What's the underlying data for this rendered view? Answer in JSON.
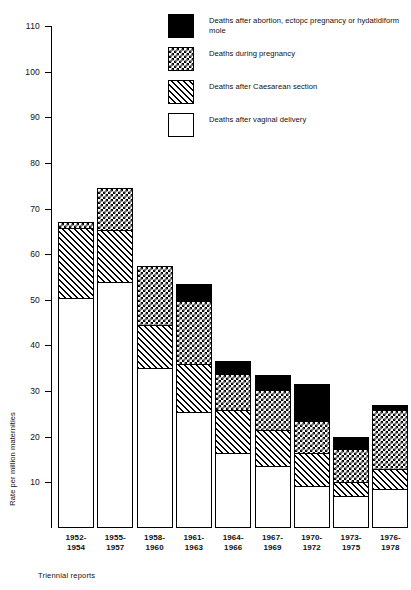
{
  "chart_data": {
    "type": "bar",
    "subtype": "stacked",
    "title": "",
    "xlabel": "Triennial reports",
    "ylabel": "Rate per million maternities",
    "ylim": [
      0,
      110
    ],
    "ytick_step": 10,
    "yticks": [
      110,
      100,
      90,
      80,
      70,
      60,
      50,
      40,
      30,
      20,
      10
    ],
    "ytick_labels": [
      "110",
      "100",
      "90",
      "80",
      "70",
      "60",
      "50",
      "40",
      "30",
      "20",
      "10"
    ],
    "grid": false,
    "legend_position": "top-right",
    "categories": [
      "1952-\n1954",
      "1955-\n1957",
      "1958-\n1960",
      "1961-\n1963",
      "1964-\n1966",
      "1967-\n1969",
      "1970-\n1972",
      "1973-\n1975",
      "1976-\n1978"
    ],
    "category_lines": [
      [
        "1952-",
        "1954"
      ],
      [
        "1955-",
        "1957"
      ],
      [
        "1958-",
        "1960"
      ],
      [
        "1961-",
        "1963"
      ],
      [
        "1964-",
        "1966"
      ],
      [
        "1967-",
        "1969"
      ],
      [
        "1970-",
        "1972"
      ],
      [
        "1973-",
        "1975"
      ],
      [
        "1976-",
        "1978"
      ]
    ],
    "series": [
      {
        "name": "Deaths after abortion, ectopic pregnancy or hydatidiform mole",
        "key": "abortion",
        "pattern": "solid-black",
        "values": [
          0,
          0,
          0,
          3.5,
          2.5,
          3.0,
          8.0,
          2.5,
          1.0
        ]
      },
      {
        "name": "Deaths during pregnancy",
        "key": "pregnancy",
        "pattern": "checkerboard",
        "values": [
          1.0,
          9.0,
          13.0,
          14.0,
          8.0,
          9.0,
          7.0,
          7.5,
          13.0
        ]
      },
      {
        "name": "Deaths after Caesarean section",
        "key": "caesarean",
        "pattern": "diagonal-hatch",
        "values": [
          15.5,
          11.5,
          9.5,
          10.5,
          9.5,
          8.0,
          7.5,
          3.0,
          4.5
        ]
      },
      {
        "name": "Deaths after vaginal delivery",
        "key": "vaginal",
        "pattern": "white",
        "values": [
          50.5,
          54.0,
          35.0,
          25.5,
          16.5,
          13.5,
          9.0,
          7.0,
          8.5
        ]
      }
    ],
    "totals": [
      67.0,
      74.5,
      57.5,
      53.5,
      36.5,
      33.5,
      31.5,
      20.0,
      27.0
    ]
  },
  "legend": {
    "items": [
      {
        "label": "Deaths after abortion, ectopc pregnancy or hydatidiform mole",
        "swatch": "solid-black-swatch"
      },
      {
        "label": "Deaths during pregnancy",
        "swatch": "checkerboard-swatch"
      },
      {
        "label": "Deaths after Caesarean section",
        "swatch": "diagonal-hatch-swatch"
      },
      {
        "label": "Deaths after vaginal delivery",
        "swatch": "white-swatch"
      }
    ]
  },
  "axes": {
    "y_title": "Rate per million maternities",
    "x_caption": "Triennial reports"
  },
  "colors": {
    "ink": "#000000",
    "background": "#ffffff"
  }
}
